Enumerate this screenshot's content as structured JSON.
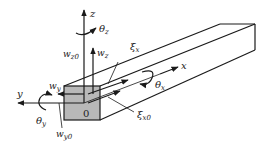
{
  "figure": {
    "colors": {
      "line": "#1a1a1a",
      "face": "#b8b8b8",
      "background": "#ffffff"
    },
    "labels": {
      "z_axis": {
        "main": "z",
        "sub": ""
      },
      "theta_z": {
        "main": "θ",
        "sub": "z"
      },
      "w_z0": {
        "main": "w",
        "sub": "z0"
      },
      "w_z": {
        "main": "w",
        "sub": "z"
      },
      "xi_x": {
        "main": "ξ",
        "sub": "x"
      },
      "x_axis": {
        "main": "x",
        "sub": ""
      },
      "theta_x": {
        "main": "θ",
        "sub": "x"
      },
      "w_y": {
        "main": "w",
        "sub": "y"
      },
      "y_axis": {
        "main": "y",
        "sub": ""
      },
      "origin": {
        "main": "0",
        "sub": ""
      },
      "theta_y": {
        "main": "θ",
        "sub": "y"
      },
      "w_y0": {
        "main": "w",
        "sub": "y0"
      },
      "xi_x0": {
        "main": "ξ",
        "sub": "x0"
      }
    }
  }
}
